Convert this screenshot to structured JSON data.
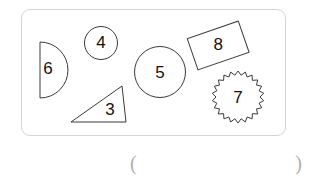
{
  "panel": {
    "border_color": "#d4d4d4",
    "background_color": "#ffffff"
  },
  "shapes": [
    {
      "id": "semicircle",
      "kind": "half-circle",
      "label": "6",
      "label_x": 48,
      "label_y": 70
    },
    {
      "id": "small-circle",
      "kind": "circle",
      "label": "4",
      "label_x": 101,
      "label_y": 43
    },
    {
      "id": "triangle",
      "kind": "right-triangle",
      "label": "3",
      "label_x": 110,
      "label_y": 112
    },
    {
      "id": "large-circle",
      "kind": "circle",
      "label": "5",
      "label_x": 160,
      "label_y": 73
    },
    {
      "id": "rectangle",
      "kind": "rotated-rectangle",
      "label": "8",
      "label_x": 218,
      "label_y": 45
    },
    {
      "id": "starburst",
      "kind": "starburst",
      "label": "7",
      "label_x": 238,
      "label_y": 98
    }
  ],
  "answer": {
    "open_paren": "(",
    "close_paren": ")",
    "value": "",
    "text_color": "#b0b0b0"
  }
}
